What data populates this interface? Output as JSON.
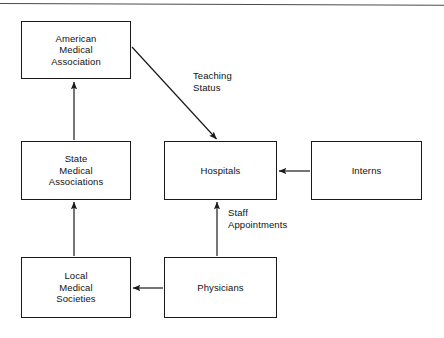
{
  "document": {
    "title": "Organizational relationships flow diagram",
    "background_color": "#ffffff",
    "line_color": "#1a1a1a",
    "text_color": "#111111"
  },
  "diagram": {
    "type": "flow-diagram",
    "nodes": [
      {
        "id": "american-medical-association",
        "label": "American\nMedical\nAssociation",
        "x": 21,
        "y": 21,
        "width": 110,
        "height": 58
      },
      {
        "id": "state-medical-associations",
        "label": "State\nMedical\nAssociations",
        "x": 21,
        "y": 141,
        "width": 110,
        "height": 59
      },
      {
        "id": "local-medical-societies",
        "label": "Local\nMedical\nSocieties",
        "x": 21,
        "y": 257,
        "width": 110,
        "height": 61
      },
      {
        "id": "hospitals",
        "label": "Hospitals",
        "x": 164,
        "y": 141,
        "width": 113,
        "height": 59
      },
      {
        "id": "interns",
        "label": "Interns",
        "x": 311,
        "y": 141,
        "width": 111,
        "height": 59
      },
      {
        "id": "physicians",
        "label": "Physicians",
        "x": 164,
        "y": 257,
        "width": 113,
        "height": 61
      }
    ],
    "edges": [
      {
        "id": "ama-to-hospitals",
        "from": "american-medical-association",
        "to": "hospitals",
        "label": "Teaching\nStatus",
        "label_x": 193,
        "label_y": 70,
        "style": "diagonal-arrow"
      },
      {
        "id": "state-to-ama",
        "from": "state-medical-associations",
        "to": "american-medical-association",
        "label": "",
        "style": "vertical-arrow-up"
      },
      {
        "id": "local-to-state",
        "from": "local-medical-societies",
        "to": "state-medical-associations",
        "label": "",
        "style": "vertical-arrow-up"
      },
      {
        "id": "physicians-to-local",
        "from": "physicians",
        "to": "local-medical-societies",
        "label": "",
        "style": "horizontal-arrow-left"
      },
      {
        "id": "physicians-to-hospitals",
        "from": "physicians",
        "to": "hospitals",
        "label": "Staff\nAppointments",
        "label_x": 228,
        "label_y": 207,
        "style": "vertical-arrow-up"
      },
      {
        "id": "interns-to-hospitals",
        "from": "interns",
        "to": "hospitals",
        "label": "",
        "style": "horizontal-arrow-left"
      }
    ]
  }
}
